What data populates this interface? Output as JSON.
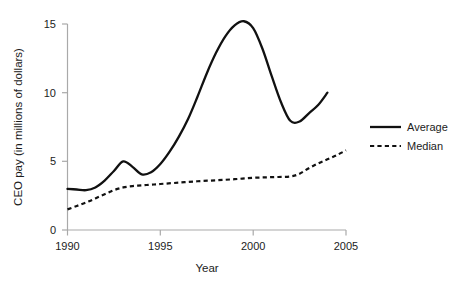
{
  "chart_data": {
    "type": "line",
    "title": "",
    "subtitle": "",
    "xlabel": "Year",
    "ylabel": "CEO pay (in millions of dollars)",
    "xlim": [
      1990,
      2005
    ],
    "ylim": [
      0,
      15.5
    ],
    "xticks": [
      "1990",
      "1995",
      "2000",
      "2005"
    ],
    "xtick_values": [
      1990,
      1995,
      2000,
      2005
    ],
    "yticks": [
      "0",
      "5",
      "10",
      "15"
    ],
    "ytick_values": [
      0,
      5,
      10,
      15
    ],
    "grid": false,
    "legend_position": "right",
    "series": [
      {
        "name": "Average",
        "style": "solid",
        "color": "#111111",
        "x": [
          1990,
          1990.5,
          1991,
          1991.5,
          1992,
          1992.5,
          1993,
          1993.5,
          1994,
          1994.5,
          1995,
          1995.5,
          1996,
          1996.5,
          1997,
          1997.5,
          1998,
          1998.5,
          1999,
          1999.5,
          2000,
          2000.5,
          2001,
          2001.5,
          2002,
          2002.5,
          2003,
          2003.5,
          2004
        ],
        "values": [
          3.0,
          2.95,
          2.9,
          3.1,
          3.6,
          4.3,
          5.0,
          4.6,
          4.05,
          4.2,
          4.8,
          5.7,
          6.8,
          8.1,
          9.7,
          11.4,
          12.9,
          14.1,
          14.9,
          15.2,
          14.7,
          13.2,
          11.2,
          9.3,
          7.95,
          7.9,
          8.5,
          9.1,
          10.0
        ]
      },
      {
        "name": "Median",
        "style": "dashed",
        "color": "#111111",
        "x": [
          1990,
          1990.5,
          1991,
          1991.5,
          1992,
          1992.5,
          1993,
          1993.5,
          1994,
          1994.5,
          1995,
          1996,
          1997,
          1998,
          1999,
          2000,
          2001,
          2002,
          2002.5,
          2003,
          2003.5,
          2004,
          2004.5,
          2005
        ],
        "values": [
          1.5,
          1.75,
          2.0,
          2.3,
          2.6,
          2.9,
          3.1,
          3.2,
          3.25,
          3.3,
          3.35,
          3.45,
          3.55,
          3.62,
          3.7,
          3.8,
          3.85,
          3.9,
          4.1,
          4.5,
          4.85,
          5.15,
          5.45,
          5.8
        ]
      }
    ],
    "annotations": []
  },
  "legend": {
    "items": [
      {
        "label": "Average",
        "style": "solid"
      },
      {
        "label": "Median",
        "style": "dashed"
      }
    ]
  },
  "axes": {
    "x_title": "Year",
    "y_title": "CEO pay (in millions of dollars)",
    "x_tick_labels": [
      "1990",
      "1995",
      "2000",
      "2005"
    ],
    "y_tick_labels": [
      "0",
      "5",
      "10",
      "15"
    ]
  },
  "colors": {
    "series_line": "#111111",
    "axis": "#a9a9a9",
    "text": "#1c1c1c",
    "background": "#ffffff"
  }
}
